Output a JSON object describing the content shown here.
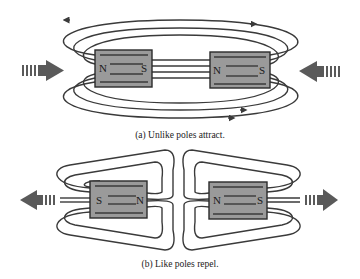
{
  "figure": {
    "panel_a": {
      "caption": "(a) Unlike poles attract.",
      "left_magnet": {
        "left_pole": "N",
        "right_pole": "S"
      },
      "right_magnet": {
        "left_pole": "N",
        "right_pole": "S"
      },
      "force_arrows": [
        "right-pointing-arrow",
        "left-pointing-arrow"
      ]
    },
    "panel_b": {
      "caption": "(b) Like poles repel.",
      "left_magnet": {
        "left_pole": "S",
        "right_pole": "N"
      },
      "right_magnet": {
        "left_pole": "N",
        "right_pole": "S"
      },
      "force_arrows": [
        "left-pointing-arrow",
        "right-pointing-arrow"
      ]
    }
  },
  "colors": {
    "magnet_fill": "#9a9a9a",
    "field_line": "#3a3a3a",
    "force_arrow": "#5a5a5a"
  }
}
